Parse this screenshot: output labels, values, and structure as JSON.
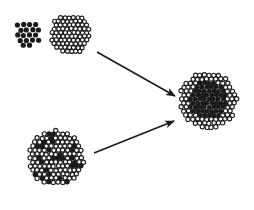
{
  "diagram": {
    "colors": {
      "background": "#ffffff",
      "ink": "#1a1a1a",
      "open_fill": "#ffffff"
    },
    "clusters": [
      {
        "id": "solid-cluster",
        "kind": "solid",
        "cx": 28,
        "cy": 33,
        "r": 16,
        "dot_r": 2.6
      },
      {
        "id": "open-cluster",
        "kind": "open",
        "cx": 70,
        "cy": 34,
        "r": 22,
        "dot_r": 2.0
      },
      {
        "id": "mixed-cluster",
        "kind": "mixed",
        "cx": 56,
        "cy": 158,
        "r": 30,
        "dot_r": 2.1
      },
      {
        "id": "core-shell-cluster",
        "kind": "core-shell",
        "cx": 208,
        "cy": 100,
        "r": 31,
        "core_r": 19,
        "dot_r": 2.1
      }
    ],
    "arrows": [
      {
        "id": "arrow-top",
        "x1": 97,
        "y1": 52,
        "x2": 175,
        "y2": 96
      },
      {
        "id": "arrow-bottom",
        "x1": 94,
        "y1": 153,
        "x2": 174,
        "y2": 121
      }
    ]
  }
}
